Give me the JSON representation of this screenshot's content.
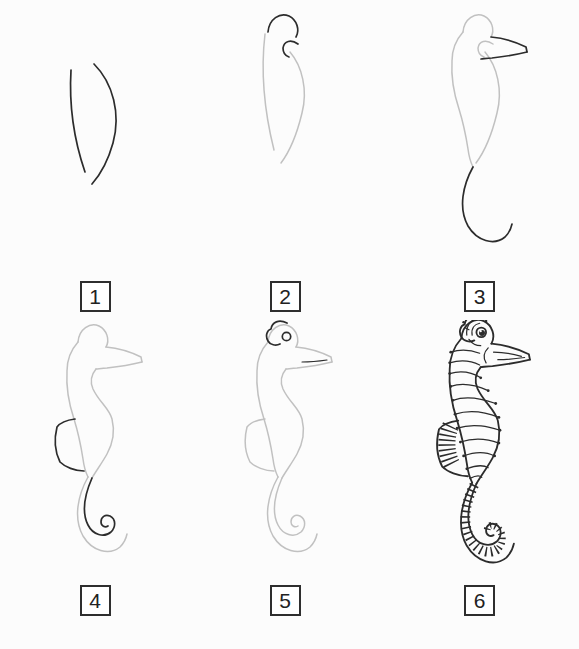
{
  "canvas": {
    "background": "#fcfcfc"
  },
  "colors": {
    "ink": "#2c2c2c",
    "guide": "#c1c1c1",
    "box_border": "#2e2e2e",
    "box_fill": "#ffffff",
    "background": "#fcfcfc"
  },
  "tutorial": {
    "steps": [
      {
        "label": "1"
      },
      {
        "label": "2"
      },
      {
        "label": "3"
      },
      {
        "label": "4"
      },
      {
        "label": "5"
      },
      {
        "label": "6"
      }
    ]
  }
}
